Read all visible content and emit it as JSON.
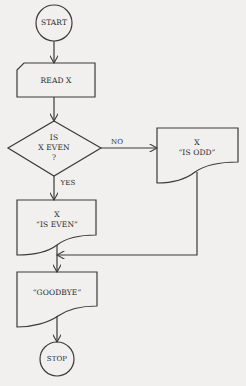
{
  "diagram": {
    "type": "flowchart",
    "colors": {
      "background": "#f1f0ee",
      "stroke": "#3a3a3a",
      "text": "#2a2a2a"
    },
    "nodes": {
      "start": {
        "shape": "terminal-circle",
        "label": "START"
      },
      "read": {
        "shape": "input-card",
        "label": "READ X"
      },
      "decision": {
        "shape": "diamond",
        "line1": "IS",
        "line2": "X EVEN",
        "line3": "?"
      },
      "odd": {
        "shape": "document",
        "line1": "X",
        "line2": "“IS ODD”"
      },
      "even": {
        "shape": "document",
        "line1": "X",
        "line2": "“IS EVEN”"
      },
      "goodbye": {
        "shape": "document",
        "label": "“GOODBYE”"
      },
      "stop": {
        "shape": "terminal-circle",
        "label": "STOP"
      }
    },
    "edges": {
      "no_label": "NO",
      "yes_label": "YES"
    }
  }
}
